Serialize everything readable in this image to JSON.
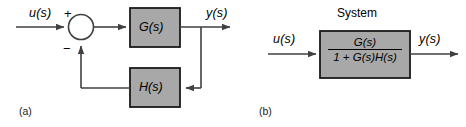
{
  "figure": {
    "background_color": "#ffffff",
    "line_color": "#404040",
    "block_fill": "#a8a8a8",
    "block_stroke": "#1a1a1a",
    "text_color": "#000000"
  },
  "panel_a": {
    "caption": "(a)",
    "input_label": "u(s)",
    "output_label": "y(s)",
    "sum_plus": "+",
    "sum_minus": "−",
    "forward_block": "G(s)",
    "feedback_block": "H(s)"
  },
  "panel_b": {
    "caption": "(b)",
    "title": "System",
    "input_label": "u(s)",
    "output_label": "y(s)",
    "numerator": "G(s)",
    "denominator": "1 + G(s)H(s)"
  }
}
